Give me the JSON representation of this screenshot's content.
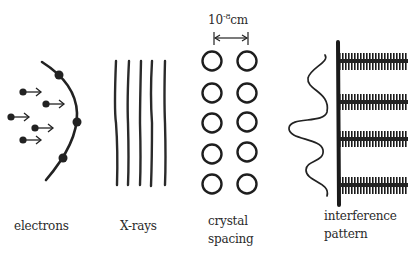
{
  "labels": {
    "electrons": "electrons",
    "xrays": "X-rays",
    "crystal_line1": "crystal",
    "crystal_line2": "spacing",
    "interference_line1": "interference",
    "interference_line2": "pattern"
  },
  "scale": {
    "base": "10",
    "exponent": "-8",
    "unit": "cm"
  },
  "colors": {
    "ink": "#222222",
    "background": "#ffffff"
  },
  "figure": {
    "electrons_count": 5,
    "wavefront_dots": 4,
    "xray_lines": 5,
    "crystal_columns": 2,
    "crystal_rows": 5,
    "interference_bands": 4
  }
}
